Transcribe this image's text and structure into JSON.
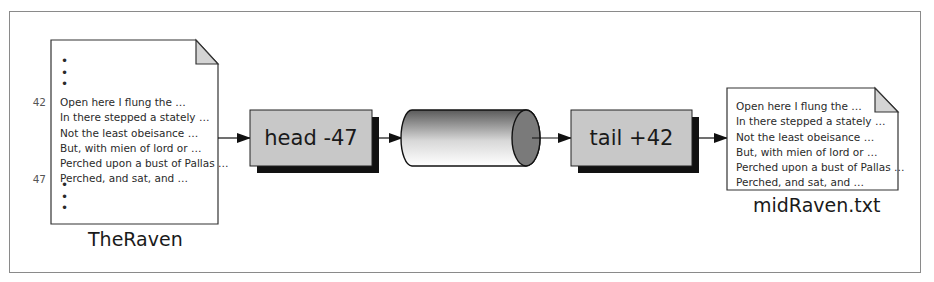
{
  "diagram": {
    "type": "pipeline",
    "source_file": {
      "caption": "TheRaven",
      "ellipsis_top": [
        "•",
        "•",
        "•"
      ],
      "ellipsis_bottom": [
        "•",
        "•",
        "•"
      ],
      "line_numbers": {
        "first": "42",
        "last": "47"
      },
      "lines": [
        "Open here I flung the …",
        "In there stepped a stately …",
        "Not the least obeisance …",
        "But, with mien of lord or …",
        "Perched upon a bust of Pallas  …",
        "Perched, and sat, and …"
      ]
    },
    "steps": [
      {
        "id": "head",
        "label": "head -47",
        "kind": "process"
      },
      {
        "id": "pipe",
        "label": "",
        "kind": "pipe-cylinder"
      },
      {
        "id": "tail",
        "label": "tail +42",
        "kind": "process"
      }
    ],
    "output_file": {
      "caption": "midRaven.txt",
      "lines": [
        "Open here I flung the …",
        "In there stepped a stately …",
        "Not the least obeisance …",
        "But, with mien of lord or …",
        "Perched upon a bust of Pallas  …",
        "Perched, and sat, and …"
      ]
    },
    "colors": {
      "frame": "#8a8a8a",
      "box_fill": "#c8c8c8",
      "shadow": "#111111",
      "fold_fill": "#d4d4d4",
      "stroke": "#222222"
    }
  }
}
